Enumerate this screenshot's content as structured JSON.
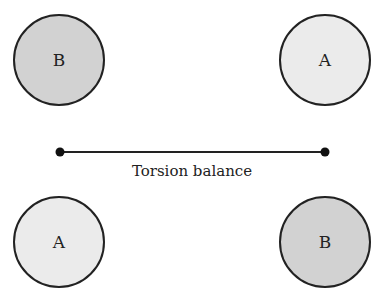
{
  "diagram": {
    "masses": [
      {
        "id": "top-left",
        "label": "B",
        "cx": 59,
        "cy": 60,
        "r": 45,
        "fill": "#d2d2d2"
      },
      {
        "id": "top-right",
        "label": "A",
        "cx": 325,
        "cy": 60,
        "r": 45,
        "fill": "#ebebeb"
      },
      {
        "id": "bottom-left",
        "label": "A",
        "cx": 59,
        "cy": 242,
        "r": 45,
        "fill": "#ebebeb"
      },
      {
        "id": "bottom-right",
        "label": "B",
        "cx": 325,
        "cy": 242,
        "r": 45,
        "fill": "#d2d2d2"
      }
    ],
    "balance": {
      "label": "Torsion balance",
      "x1": 60,
      "y1": 152,
      "x2": 325,
      "y2": 152,
      "end_dot_radius": 4.5,
      "label_x": 192,
      "label_y": 176
    },
    "colors": {
      "stroke": "#222222",
      "mass_b_fill": "#d2d2d2",
      "mass_a_fill": "#ebebeb"
    }
  }
}
